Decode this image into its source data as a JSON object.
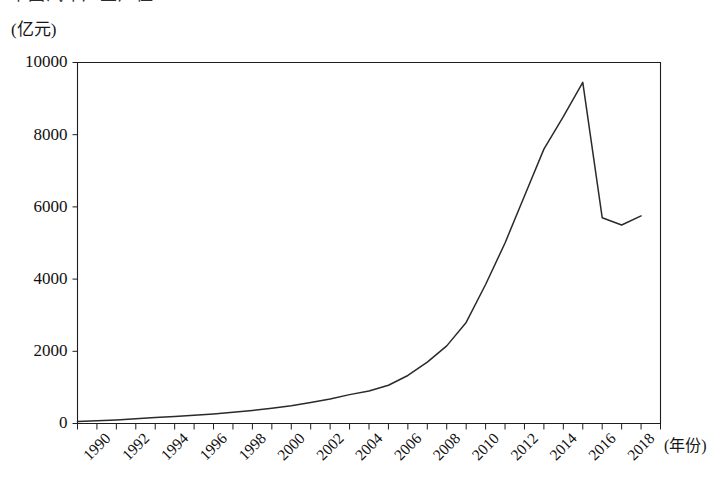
{
  "header": {
    "clipped_title_fragment": "中国汽车产业产值",
    "y_unit": "(亿元)",
    "x_unit": "(年份)"
  },
  "chart_data": {
    "type": "line",
    "title": "",
    "xlabel": "(年份)",
    "ylabel": "(亿元)",
    "xlim": [
      1990,
      2020
    ],
    "ylim": [
      0,
      10000
    ],
    "grid": false,
    "legend": false,
    "y_ticks": [
      0,
      2000,
      4000,
      6000,
      8000,
      10000
    ],
    "y_tick_labels": [
      "0",
      "2000",
      "4000",
      "6000",
      "8000",
      "10000"
    ],
    "x_ticks": [
      1990,
      1992,
      1994,
      1996,
      1998,
      2000,
      2002,
      2004,
      2006,
      2008,
      2010,
      2012,
      2014,
      2016,
      2018
    ],
    "x_tick_labels": [
      "1990",
      "1992",
      "1994",
      "1996",
      "1998",
      "2000",
      "2002",
      "2004",
      "2006",
      "2008",
      "2010",
      "2012",
      "2014",
      "2016",
      "2018"
    ],
    "x_minor_tick_step": 1,
    "series": [
      {
        "name": "",
        "x": [
          1990,
          1991,
          1992,
          1993,
          1994,
          1995,
          1996,
          1997,
          1998,
          1999,
          2000,
          2001,
          2002,
          2003,
          2004,
          2005,
          2006,
          2007,
          2008,
          2009,
          2010,
          2011,
          2012,
          2013,
          2014,
          2015,
          2016,
          2017,
          2018,
          2019
        ],
        "values": [
          55,
          75,
          100,
          130,
          165,
          195,
          230,
          265,
          310,
          360,
          420,
          490,
          580,
          680,
          800,
          900,
          1060,
          1330,
          1700,
          2150,
          2800,
          3850,
          5000,
          6300,
          7600,
          8500,
          9450,
          5700,
          5500,
          5750
        ]
      }
    ]
  }
}
